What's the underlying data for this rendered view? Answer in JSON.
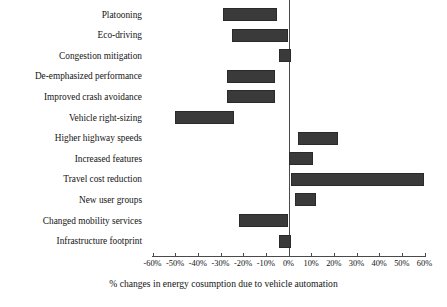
{
  "chart_data": {
    "type": "bar",
    "orientation": "horizontal",
    "title": "",
    "subtitle": "",
    "xlabel": "% changes in energy cosumption due to vehicle automation",
    "ylabel": "",
    "xlim": [
      -60,
      60
    ],
    "ylim": null,
    "grid": false,
    "legend": null,
    "bar_color": "#3a3a3a",
    "axis_color": "#4a4a4a",
    "xticks": [
      -60,
      -50,
      -40,
      -30,
      -20,
      -10,
      0,
      10,
      20,
      30,
      40,
      50,
      60
    ],
    "xtick_labels": [
      "-60%",
      "-50%",
      "-40%",
      "-30%",
      "-20%",
      "-10%",
      "0%",
      "10%",
      "20%",
      "30%",
      "40%",
      "50%",
      "60%"
    ],
    "categories": [
      "Platooning",
      "Eco-driving",
      "Congestion mitigation",
      "De-emphasized performance",
      "Improved crash avoidance",
      "Vehicle right-sizing",
      "Higher highway speeds",
      "Increased features",
      "Travel cost reduction",
      "New user groups",
      "Changed mobility services",
      "Infrastructure footprint"
    ],
    "ranges": [
      {
        "category": "Platooning",
        "low": -29,
        "high": -5
      },
      {
        "category": "Eco-driving",
        "low": -25,
        "high": 0
      },
      {
        "category": "Congestion mitigation",
        "low": -4,
        "high": 1
      },
      {
        "category": "De-emphasized performance",
        "low": -27,
        "high": -6
      },
      {
        "category": "Improved crash avoidance",
        "low": -27,
        "high": -6
      },
      {
        "category": "Vehicle right-sizing",
        "low": -50,
        "high": -24
      },
      {
        "category": "Higher highway speeds",
        "low": 4,
        "high": 22
      },
      {
        "category": "Increased features",
        "low": 0,
        "high": 11
      },
      {
        "category": "Travel cost reduction",
        "low": 1,
        "high": 60
      },
      {
        "category": "New user groups",
        "low": 3,
        "high": 12
      },
      {
        "category": "Changed mobility services",
        "low": -22,
        "high": 0
      },
      {
        "category": "Infrastructure footprint",
        "low": -4,
        "high": 1
      }
    ]
  }
}
